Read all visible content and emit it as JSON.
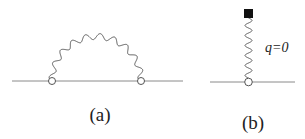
{
  "diagrams": [
    {
      "id": "a",
      "caption": "(a)",
      "description": "self-energy diagram: fermion line with wavy propagator arc between two vertices"
    },
    {
      "id": "b",
      "caption": "(b)",
      "description": "tadpole-like diagram: wavy line from vertex ending at a filled square source",
      "momentum_label": "q=0"
    }
  ],
  "colors": {
    "line": "#8a8a8a",
    "wavy": "#555555",
    "source": "#111111"
  }
}
